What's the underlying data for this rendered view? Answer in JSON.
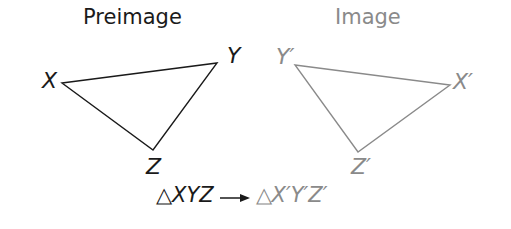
{
  "diagram": {
    "type": "geometric-transformation",
    "preimage": {
      "heading": "Preimage",
      "color": "#1a1a1a",
      "vertices": [
        {
          "name": "X",
          "label": "X",
          "x": 62,
          "y": 83
        },
        {
          "name": "Y",
          "label": "Y",
          "x": 217,
          "y": 63
        },
        {
          "name": "Z",
          "label": "Z",
          "x": 153,
          "y": 150
        }
      ]
    },
    "image": {
      "heading": "Image",
      "color": "#8a8a8a",
      "vertices": [
        {
          "name": "Y'",
          "label": "Y′",
          "x": 295,
          "y": 65
        },
        {
          "name": "X'",
          "label": "X′",
          "x": 450,
          "y": 85
        },
        {
          "name": "Z'",
          "label": "Z′",
          "x": 358,
          "y": 152
        }
      ]
    },
    "mapping": {
      "preimage_delta": "△",
      "preimage_name": "XYZ",
      "arrow": "→",
      "image_delta": "△",
      "image_name": "X′Y′Z′"
    }
  }
}
